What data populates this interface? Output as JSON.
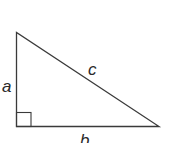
{
  "diagram": {
    "type": "right-triangle",
    "labels": {
      "vertical_leg": "a",
      "horizontal_leg": "b",
      "hypotenuse": "c"
    },
    "right_angle_marker": true,
    "colors": {
      "stroke": "#3a3a3a",
      "background": "#ffffff"
    }
  }
}
